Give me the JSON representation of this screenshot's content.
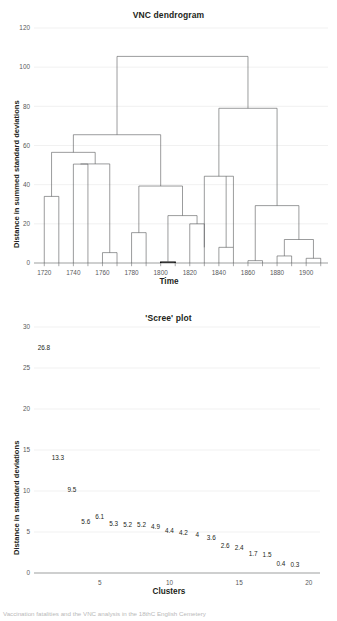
{
  "page": {
    "bottom_cut_text": "Vaccination fatalities and the VNC analysis in the 18thC English Cemetery"
  },
  "chart_data": [
    {
      "type": "line",
      "name": "vnc-dendrogram",
      "title": "VNC dendrogram",
      "xlabel": "Time",
      "ylabel": "Distance in summed standard deviations",
      "ylim": [
        0,
        120
      ],
      "yticks": [
        0,
        20,
        40,
        60,
        80,
        100,
        120
      ],
      "xlim": [
        1710,
        1910
      ],
      "xticks": [
        1720,
        1740,
        1760,
        1780,
        1800,
        1820,
        1840,
        1860,
        1880,
        1900
      ],
      "grid": true,
      "leaves": [
        1720,
        1730,
        1740,
        1750,
        1760,
        1770,
        1780,
        1790,
        1800,
        1810,
        1820,
        1830,
        1840,
        1850,
        1860,
        1870,
        1880,
        1890,
        1900,
        1910
      ],
      "merges": [
        {
          "left": 1720,
          "right": 1730,
          "height": 34
        },
        {
          "left": 1740,
          "right": 1750,
          "height": 50.5
        },
        {
          "left": 1760,
          "right": 1770,
          "height": 5.3
        },
        {
          "left": 1780,
          "right": 1790,
          "height": 15.5
        },
        {
          "left": 1800,
          "right": 1810,
          "height": 0.4
        },
        {
          "left": 1820,
          "right": 1830,
          "height": 20
        },
        {
          "left": 1840,
          "right": 1850,
          "height": 8
        },
        {
          "left": 1860,
          "right": 1870,
          "height": 1.2
        },
        {
          "left": 1880,
          "right": 1890,
          "height": 3.6
        },
        {
          "left": 1900,
          "right": 1910,
          "height": 2.4
        },
        {
          "height": 12,
          "note": "join of (1860-1870) and (1880-1890) with (1900-1910)"
        },
        {
          "height": 24.2,
          "note": "join of (1800-1810) with (1820-1830)"
        },
        {
          "height": 29.3,
          "note": "join right low cluster"
        },
        {
          "height": 39.3,
          "note": "join (1780-1790) with (1800..1830)"
        },
        {
          "height": 44.3,
          "note": "join (1840-1850) group"
        },
        {
          "height": 56.5,
          "note": "join (1720-1730) with (1740..1770)"
        },
        {
          "height": 65.5,
          "note": "left supercluster"
        },
        {
          "height": 79,
          "note": "right supercluster"
        },
        {
          "height": 105.5,
          "note": "root"
        }
      ]
    },
    {
      "type": "scatter",
      "name": "scree-plot",
      "title": "'Scree' plot",
      "xlabel": "Clusters",
      "ylabel": "Distance in standard deviations",
      "ylim": [
        0,
        30
      ],
      "yticks": [
        0,
        5,
        10,
        15,
        20,
        25,
        30
      ],
      "xlim": [
        0.5,
        20.8
      ],
      "xticks": [
        5,
        10,
        15,
        20
      ],
      "grid": true,
      "x": [
        1,
        2,
        3,
        4,
        5,
        6,
        7,
        8,
        9,
        10,
        11,
        12,
        13,
        14,
        15,
        16,
        17,
        18,
        19
      ],
      "values": [
        26.8,
        13.3,
        9.5,
        5.6,
        6.1,
        5.3,
        5.2,
        5.2,
        4.9,
        4.4,
        4.2,
        4,
        3.6,
        2.6,
        2.4,
        1.7,
        1.5,
        0.4,
        0.3
      ],
      "labels": [
        "26.8",
        "13.3",
        "9.5",
        "5.6",
        "6.1",
        "5.3",
        "5.2",
        "5.2",
        "4.9",
        "4.4",
        "4.2",
        "4",
        "3.6",
        "2.6",
        "2.4",
        "1.7",
        "1.5",
        "0.4",
        "0.3"
      ]
    }
  ]
}
